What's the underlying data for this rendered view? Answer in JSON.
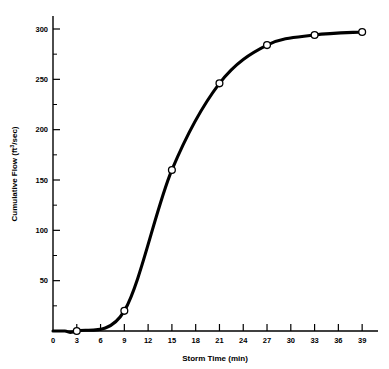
{
  "chart_data": {
    "type": "line",
    "title": "",
    "subtitle": "",
    "xlabel": "Storm Time (min)",
    "ylabel": "Cumulative Flow (ft3/sec)",
    "ylabel_parts": {
      "prefix": "Cumulative Flow (ft",
      "superscript": "3",
      "suffix": "/sec)"
    },
    "x": [
      3,
      9,
      15,
      21,
      27,
      33,
      39
    ],
    "values": [
      0,
      20,
      160,
      246,
      284,
      294,
      297
    ],
    "series": [
      {
        "name": "Cumulative Flow",
        "x": [
          3,
          9,
          15,
          21,
          27,
          33,
          39
        ],
        "values": [
          0,
          20,
          160,
          246,
          284,
          294,
          297
        ]
      }
    ],
    "xlim": [
      0,
      41
    ],
    "ylim": [
      0,
      310
    ],
    "xticks": [
      0,
      3,
      6,
      9,
      12,
      15,
      18,
      21,
      24,
      27,
      30,
      33,
      36,
      39
    ],
    "xtick_labels": [
      "0",
      "3",
      "6",
      "9",
      "12",
      "15",
      "18",
      "21",
      "24",
      "27",
      "30",
      "33",
      "36",
      "39"
    ],
    "yticks": [
      50,
      100,
      150,
      200,
      250,
      300
    ],
    "ytick_labels": [
      "50",
      "100",
      "150",
      "200",
      "250",
      "300"
    ],
    "yticks_minor": [
      25,
      75,
      125,
      175,
      225,
      275
    ],
    "grid": false,
    "legend": false,
    "legend_position": "none",
    "marker": "open-circle",
    "line_color": "#000000",
    "marker_fill": "#ffffff",
    "background": "#ffffff"
  }
}
